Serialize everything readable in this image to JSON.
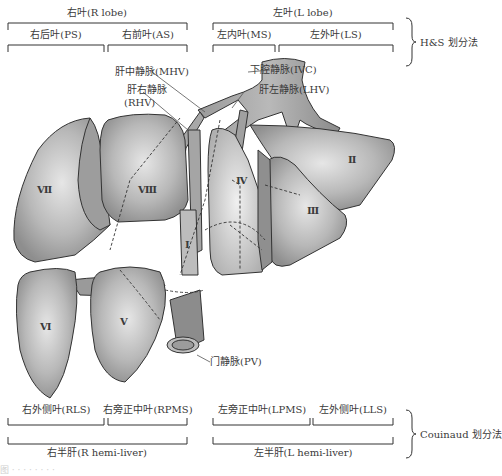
{
  "figure": {
    "hs_method": {
      "label": "H&S 划分法",
      "right_lobe": "右叶(R lobe)",
      "left_lobe": "左叶(L lobe)",
      "right_posterior": "右后叶(PS)",
      "right_anterior": "右前叶(AS)",
      "left_medial": "左内叶(MS)",
      "left_lateral": "左外叶(LS)"
    },
    "vessels": {
      "ivc": "下腔静脉(IVC)",
      "mhv": "肝中静脉(MHV)",
      "rhv_line1": "肝右静脉",
      "rhv_line2": "(RHV)",
      "lhv": "肝左静脉(LHV)",
      "pv": "门静脉(PV)"
    },
    "segments": {
      "s1": "Ⅰ",
      "s2": "Ⅱ",
      "s3": "Ⅲ",
      "s4": "Ⅳ",
      "s5": "Ⅴ",
      "s6": "Ⅵ",
      "s7": "Ⅶ",
      "s8": "Ⅷ"
    },
    "couinaud_method": {
      "label": "Couinaud 划分法",
      "right_lateral": "右外侧叶(RLS)",
      "right_paramedian": "右旁正中叶(RPMS)",
      "left_paramedian": "左旁正中叶(LPMS)",
      "left_lateral": "左外侧叶(LLS)",
      "right_hemi": "右半肝(R hemi-liver)",
      "left_hemi": "左半肝(L hemi-liver)"
    },
    "caption_fragment": "图 ·  ·  ·  ·  ·  ·  ·  ·"
  }
}
